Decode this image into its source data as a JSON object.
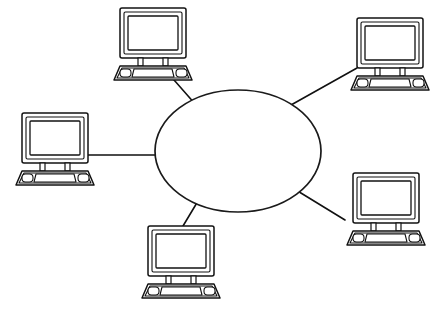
{
  "diagram": {
    "type": "star-network",
    "background_color": "#ffffff",
    "line_color": "#111111",
    "fill_color": "#ffffff",
    "style": "hand-drawn line art",
    "center": {
      "name": "network-cloud",
      "shape": "ellipse",
      "label": "",
      "cx": 238,
      "cy": 151,
      "rx": 83,
      "ry": 61
    },
    "nodes": [
      {
        "id": "node-top-left",
        "label": "",
        "icon": "computer-icon",
        "x": 112,
        "y": 8,
        "width": 82,
        "height": 68
      },
      {
        "id": "node-top-right",
        "label": "",
        "icon": "computer-icon",
        "x": 349,
        "y": 18,
        "width": 82,
        "height": 68
      },
      {
        "id": "node-left",
        "label": "",
        "icon": "computer-icon",
        "x": 14,
        "y": 113,
        "width": 82,
        "height": 68
      },
      {
        "id": "node-right",
        "label": "",
        "icon": "computer-icon",
        "x": 345,
        "y": 173,
        "width": 82,
        "height": 68
      },
      {
        "id": "node-bottom",
        "label": "",
        "icon": "computer-icon",
        "x": 140,
        "y": 226,
        "width": 82,
        "height": 68
      }
    ],
    "links": [
      {
        "id": "link-top-left",
        "from": "node-top-left",
        "to": "network-cloud",
        "x1": 167,
        "y1": 72,
        "x2": 196,
        "y2": 105
      },
      {
        "id": "link-top-right",
        "from": "node-top-right",
        "to": "network-cloud",
        "x1": 357,
        "y1": 68,
        "x2": 291,
        "y2": 105
      },
      {
        "id": "link-left",
        "from": "node-left",
        "to": "network-cloud",
        "x1": 88,
        "y1": 155,
        "x2": 156,
        "y2": 155
      },
      {
        "id": "link-right",
        "from": "node-right",
        "to": "network-cloud",
        "x1": 345,
        "y1": 220,
        "x2": 296,
        "y2": 190
      },
      {
        "id": "link-bottom",
        "from": "node-bottom",
        "to": "network-cloud",
        "x1": 183,
        "y1": 226,
        "x2": 198,
        "y2": 201
      }
    ]
  }
}
